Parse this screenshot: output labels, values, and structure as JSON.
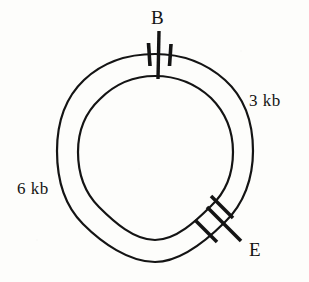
{
  "figure": {
    "type": "plasmid-restriction-map",
    "background_color": "#fdfdfb",
    "ink_color": "#141414"
  },
  "circles": {
    "center_x": 155,
    "center_y": 152,
    "outer_radius": 98,
    "inner_radius": 77,
    "stroke_width": 2.2
  },
  "sites": [
    {
      "id": "site-b",
      "label": "B",
      "angle_deg": 270,
      "position": "top",
      "tick_style": "radial-bar-with-two-flanking-ticks"
    },
    {
      "id": "site-e",
      "label": "E",
      "angle_deg": 48,
      "position": "lower-right",
      "tick_style": "radial-bar-with-two-flanking-ticks"
    }
  ],
  "fragments": [
    {
      "id": "fragment-right",
      "label": "3 kb",
      "side": "right",
      "label_x": 249,
      "label_y": 92
    },
    {
      "id": "fragment-left",
      "label": "6 kb",
      "side": "left",
      "label_x": 17,
      "label_y": 180
    }
  ],
  "labels": {
    "site_b": "B",
    "site_e": "E",
    "fragment_3kb": "3 kb",
    "fragment_6kb": "6 kb"
  }
}
